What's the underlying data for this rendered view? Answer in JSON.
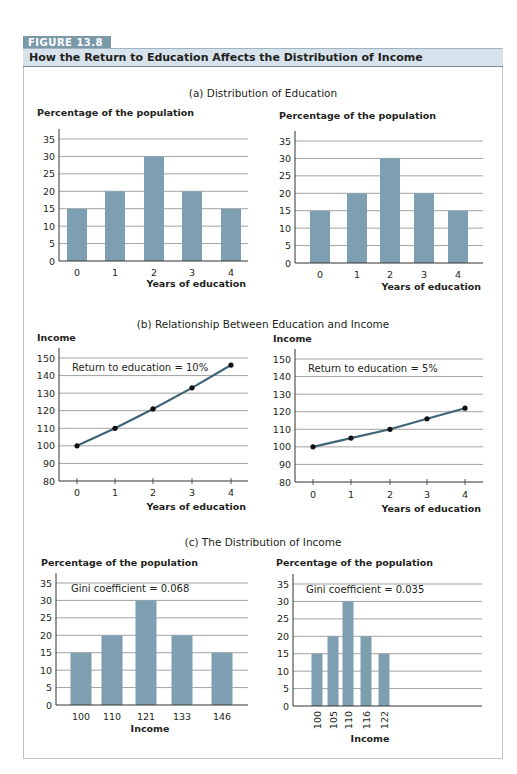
{
  "figure": {
    "label": "FIGURE 13.8",
    "title": "How the Return to Education Affects the Distribution of Income",
    "colors": {
      "bar": "#7e9fb1",
      "line": "#3f6476",
      "point": "#111111",
      "grid": "#8a8a8a",
      "tab": "#7c99aa",
      "header": "#d6e3ec"
    }
  },
  "panels": [
    {
      "title": "(a) Distribution of Education"
    },
    {
      "title": "(b) Relationship Between Education and Income"
    },
    {
      "title": "(c) The Distribution of Income"
    }
  ],
  "chart_data": [
    {
      "id": "a-left",
      "type": "bar",
      "panel": "(a) Distribution of Education",
      "ylabel": "Percentage of the population",
      "xlabel": "Years of education",
      "categories": [
        "0",
        "1",
        "2",
        "3",
        "4"
      ],
      "values": [
        15,
        20,
        30,
        20,
        15
      ],
      "ylim": [
        0,
        35
      ],
      "yticks": [
        0,
        5,
        10,
        15,
        20,
        25,
        30,
        35
      ],
      "grid": true,
      "annotation": ""
    },
    {
      "id": "a-right",
      "type": "bar",
      "panel": "(a) Distribution of Education",
      "ylabel": "Percentage of the population",
      "xlabel": "Years of education",
      "categories": [
        "0",
        "1",
        "2",
        "3",
        "4"
      ],
      "values": [
        15,
        20,
        30,
        20,
        15
      ],
      "ylim": [
        0,
        35
      ],
      "yticks": [
        0,
        5,
        10,
        15,
        20,
        25,
        30,
        35
      ],
      "grid": true,
      "annotation": ""
    },
    {
      "id": "b-left",
      "type": "line",
      "panel": "(b) Relationship Between Education and Income",
      "ylabel": "Income",
      "xlabel": "Years of education",
      "x": [
        0,
        1,
        2,
        3,
        4
      ],
      "values": [
        100,
        110,
        121,
        133,
        146
      ],
      "ylim": [
        80,
        150
      ],
      "yticks": [
        80,
        90,
        100,
        110,
        120,
        130,
        140,
        150
      ],
      "grid": true,
      "annotation": "Return to education = 10%"
    },
    {
      "id": "b-right",
      "type": "line",
      "panel": "(b) Relationship Between Education and Income",
      "ylabel": "Income",
      "xlabel": "Years of education",
      "x": [
        0,
        1,
        2,
        3,
        4
      ],
      "values": [
        100,
        105,
        110,
        116,
        122
      ],
      "ylim": [
        80,
        150
      ],
      "yticks": [
        80,
        90,
        100,
        110,
        120,
        130,
        140,
        150
      ],
      "grid": true,
      "annotation": "Return to education = 5%"
    },
    {
      "id": "c-left",
      "type": "bar",
      "panel": "(c) The Distribution of Income",
      "ylabel": "Percentage of the population",
      "xlabel": "Income",
      "categories": [
        "100",
        "110",
        "121",
        "133",
        "146"
      ],
      "values": [
        15,
        20,
        30,
        20,
        15
      ],
      "ylim": [
        0,
        35
      ],
      "yticks": [
        0,
        5,
        10,
        15,
        20,
        25,
        30,
        35
      ],
      "grid": true,
      "annotation": "Gini coefficient = 0.068"
    },
    {
      "id": "c-right",
      "type": "bar",
      "panel": "(c) The Distribution of Income",
      "ylabel": "Percentage of the population",
      "xlabel": "Income",
      "categories": [
        "100",
        "105",
        "110",
        "116",
        "122"
      ],
      "values": [
        15,
        20,
        30,
        20,
        15
      ],
      "ylim": [
        0,
        35
      ],
      "yticks": [
        0,
        5,
        10,
        15,
        20,
        25,
        30,
        35
      ],
      "grid": true,
      "annotation": "Gini coefficient = 0.035",
      "rotated_xticks": true
    }
  ]
}
